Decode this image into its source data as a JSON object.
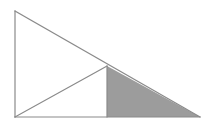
{
  "figure": {
    "name": "right-triangle-with-shaded-subtriangle",
    "type": "geometric-diagram",
    "canvas": {
      "width": 212,
      "height": 128
    },
    "background_color": "#ffffff",
    "stroke_color": "#8a8a8a",
    "stroke_width": 1.2,
    "shaded_fill_color": "#9c9c9c",
    "unshaded_fill_color": "#ffffff",
    "points": {
      "apex_top_left": {
        "x": 15,
        "y": 11
      },
      "corner_bottom_left": {
        "x": 15,
        "y": 117
      },
      "corner_bottom_right": {
        "x": 200,
        "y": 117
      },
      "hypotenuse_junction": {
        "x": 107,
        "y": 66
      },
      "base_midpoint_foot": {
        "x": 107,
        "y": 117
      }
    },
    "shapes": [
      {
        "name": "outer-right-triangle",
        "kind": "polygon",
        "vertices": "15,11 15,117 200,117",
        "fill": "#ffffff",
        "stroke": "#8a8a8a",
        "shaded": false
      },
      {
        "name": "shaded-right-triangle",
        "kind": "polygon",
        "vertices": "107,66 107,117 200,117",
        "fill": "#9c9c9c",
        "stroke": "#8a8a8a",
        "shaded": true
      }
    ],
    "segments": [
      {
        "name": "left-vertical-leg",
        "from": "apex_top_left",
        "to": "corner_bottom_left",
        "path": "M 15 11 L 15 117"
      },
      {
        "name": "bottom-horizontal-leg",
        "from": "corner_bottom_left",
        "to": "corner_bottom_right",
        "path": "M 15 117 L 200 117"
      },
      {
        "name": "main-hypotenuse",
        "from": "apex_top_left",
        "to": "corner_bottom_right",
        "path": "M 15 11 L 200 117"
      },
      {
        "name": "interior-diagonal-cevian",
        "from": "corner_bottom_left",
        "to": "hypotenuse_junction",
        "path": "M 15 117 L 107 66"
      },
      {
        "name": "interior-vertical-divider",
        "from": "hypotenuse_junction",
        "to": "base_midpoint_foot",
        "path": "M 107 66 L 107 117"
      }
    ],
    "labels": []
  }
}
